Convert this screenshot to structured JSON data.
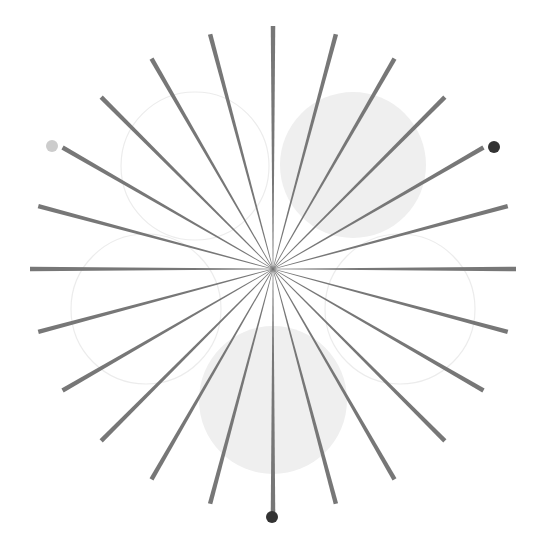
{
  "diagram": {
    "type": "starburst-with-circles",
    "canvas": {
      "width": 543,
      "height": 540,
      "background": "#ffffff"
    },
    "center": {
      "x": 273,
      "y": 269
    },
    "rays": {
      "count": 24,
      "step_deg": 15,
      "length": 243,
      "color": "#777777",
      "inner_width": 0.6,
      "outer_width": 4.5
    },
    "circles": [
      {
        "name": "circle-top-left",
        "cx": 195,
        "cy": 166,
        "r": 74,
        "fill": "none",
        "stroke": "#ececec"
      },
      {
        "name": "circle-top-right",
        "cx": 353,
        "cy": 165,
        "r": 73,
        "fill": "#efefef",
        "stroke": "none"
      },
      {
        "name": "circle-left",
        "cx": 146,
        "cy": 309,
        "r": 75,
        "fill": "none",
        "stroke": "#ececec"
      },
      {
        "name": "circle-right",
        "cx": 400,
        "cy": 309,
        "r": 75,
        "fill": "none",
        "stroke": "#ececec"
      },
      {
        "name": "circle-bottom",
        "cx": 273,
        "cy": 400,
        "r": 74,
        "fill": "#efefef",
        "stroke": "none"
      }
    ],
    "dots": [
      {
        "name": "dot-top-left",
        "cx": 52,
        "cy": 146,
        "r": 6,
        "color": "#cccccc"
      },
      {
        "name": "dot-top-right",
        "cx": 494,
        "cy": 147,
        "r": 6,
        "color": "#333333"
      },
      {
        "name": "dot-bottom",
        "cx": 272,
        "cy": 517,
        "r": 6,
        "color": "#333333"
      }
    ]
  }
}
